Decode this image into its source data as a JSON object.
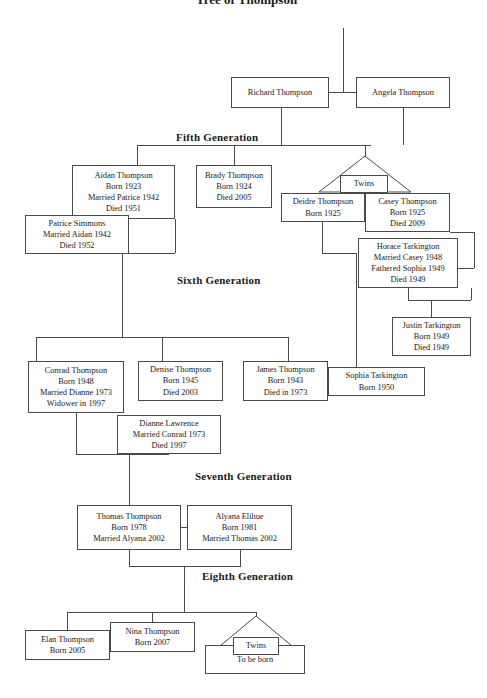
{
  "document": {
    "title": "Tree of Thompson"
  },
  "generation_headings": [
    {
      "id": "fifth",
      "label": "Fifth Generation",
      "x": 174,
      "y": 131
    },
    {
      "id": "sixth",
      "label": "Sixth Generation",
      "x": 175,
      "y": 274
    },
    {
      "id": "seventh",
      "label": "Seventh Generation",
      "x": 193,
      "y": 470
    },
    {
      "id": "eighth",
      "label": "Eighth Generation",
      "x": 200,
      "y": 570
    }
  ],
  "nodes": [
    {
      "id": "richard-thompson",
      "name": "Richard Thompson",
      "lines": [
        "Richard Thompson"
      ],
      "x": 231,
      "y": 77,
      "w": 98,
      "h": 31
    },
    {
      "id": "angela-thompson",
      "name": "Angela Thompson",
      "lines": [
        "Angela Thompson"
      ],
      "x": 356,
      "y": 77,
      "w": 94,
      "h": 31
    },
    {
      "id": "aidan-thompson",
      "name": "Aidan Thompson",
      "lines": [
        "Aidan Thompson",
        "Born 1923",
        "Married Patrice 1942",
        "Died 1951"
      ],
      "x": 72,
      "y": 165,
      "w": 103,
      "h": 54
    },
    {
      "id": "brady-thompson",
      "name": "Brady Thompson",
      "lines": [
        "Brady Thompson",
        "Born 1924",
        "Died 2005"
      ],
      "x": 196,
      "y": 165,
      "w": 76,
      "h": 43
    },
    {
      "id": "patrice-simmons",
      "name": "Patrice Simmons",
      "lines": [
        "Patrice Simmons",
        "Married Aidan 1942",
        "Died 1952"
      ],
      "x": 25,
      "y": 215,
      "w": 104,
      "h": 39
    },
    {
      "id": "deidre-thompson",
      "name": "Deidre Thompson",
      "lines": [
        "Deidre Thompson",
        "Born 1925"
      ],
      "x": 281,
      "y": 193,
      "w": 84,
      "h": 29
    },
    {
      "id": "casey-thompson",
      "name": "Casey Thompson",
      "lines": [
        "Casey Thompson",
        "Born 1925",
        "Died 2009"
      ],
      "x": 365,
      "y": 193,
      "w": 85,
      "h": 39
    },
    {
      "id": "horace-tarkington",
      "name": "Horace Tarkington",
      "lines": [
        "Horace Tarkington",
        "Married Casey 1948",
        "Fathered Sophia 1949",
        "Died 1949"
      ],
      "x": 358,
      "y": 238,
      "w": 100,
      "h": 50
    },
    {
      "id": "justin-tarkington",
      "name": "Justin Tarkington",
      "lines": [
        "Justin Tarkington",
        "Born 1949",
        "Died 1949"
      ],
      "x": 392,
      "y": 317,
      "w": 79,
      "h": 39
    },
    {
      "id": "sophia-tarkington",
      "name": "Sophia Tarkington",
      "lines": [
        "Sophia Tarkington",
        "Born 1950"
      ],
      "x": 328,
      "y": 367,
      "w": 97,
      "h": 29
    },
    {
      "id": "conrad-thompson",
      "name": "Conrad Thompson",
      "lines": [
        "Conrad Thompson",
        "Born 1948",
        "Married Dianne 1973",
        "Widower in 1997"
      ],
      "x": 28,
      "y": 361,
      "w": 96,
      "h": 52
    },
    {
      "id": "denise-thompson",
      "name": "Denise Thompson",
      "lines": [
        "Denise Thompson",
        "Born 1945",
        "Died 2003"
      ],
      "x": 138,
      "y": 361,
      "w": 85,
      "h": 40
    },
    {
      "id": "james-thompson",
      "name": "James Thompson",
      "lines": [
        "James Thompson",
        "Born 1943",
        "Died in 1973"
      ],
      "x": 243,
      "y": 361,
      "w": 85,
      "h": 40
    },
    {
      "id": "dianne-lawrence",
      "name": "Dianne Lawrence",
      "lines": [
        "Dianne Lawrence",
        "Married Conrad 1973",
        "Died 1997"
      ],
      "x": 117,
      "y": 415,
      "w": 104,
      "h": 39
    },
    {
      "id": "thomas-thompson",
      "name": "Thomas Thompson",
      "lines": [
        "Thomas Thompson",
        "Born 1978",
        "Married Alyana 2002"
      ],
      "x": 77,
      "y": 505,
      "w": 104,
      "h": 45
    },
    {
      "id": "alyana-elihue",
      "name": "Alyana Elihue",
      "lines": [
        "Alyana Elihue",
        "Born 1981",
        "Married Thomas 2002"
      ],
      "x": 187,
      "y": 505,
      "w": 105,
      "h": 45
    },
    {
      "id": "elan-thompson",
      "name": "Elan Thompson",
      "lines": [
        "Elan Thompson",
        "Born 2005"
      ],
      "x": 25,
      "y": 630,
      "w": 85,
      "h": 30
    },
    {
      "id": "nina-thompson",
      "name": "Nina Thompson",
      "lines": [
        "Nina Thompson",
        "Born 2007"
      ],
      "x": 110,
      "y": 622,
      "w": 85,
      "h": 30
    },
    {
      "id": "to-be-born",
      "name": "To be born",
      "lines": [
        "To be born"
      ],
      "x": 205,
      "y": 645,
      "w": 100,
      "h": 29
    },
    {
      "id": "twins-label-top",
      "name": "Twins",
      "lines": [
        "Twins"
      ],
      "x": 340,
      "y": 175,
      "w": 48,
      "h": 18
    },
    {
      "id": "twins-label-bottom",
      "name": "Twins",
      "lines": [
        "Twins"
      ],
      "x": 233,
      "y": 637,
      "w": 46,
      "h": 18
    }
  ],
  "twin_markers": [
    {
      "id": "twins-marker-fifth",
      "x": 318,
      "y": 155,
      "w": 94,
      "h": 38
    },
    {
      "id": "twins-marker-eighth",
      "x": 213,
      "y": 615,
      "w": 86,
      "h": 37
    }
  ],
  "connectors": {
    "horizontal": [
      {
        "id": "richard-angela-marriage",
        "x": 329,
        "y": 92,
        "w": 27
      },
      {
        "id": "gen5-sibling-bus",
        "x": 137,
        "y": 145,
        "w": 234
      },
      {
        "id": "aidan-patrice-join",
        "x": 122,
        "y": 253,
        "w": 53
      },
      {
        "id": "gen6-sibling-bus",
        "x": 36,
        "y": 337,
        "w": 252
      },
      {
        "id": "deidre-down-turn",
        "x": 322,
        "y": 253,
        "w": 34
      },
      {
        "id": "casey-horace-join",
        "x": 450,
        "y": 232,
        "w": 24
      },
      {
        "id": "casey-horace-join-low",
        "x": 458,
        "y": 268,
        "w": 16
      },
      {
        "id": "justin-parent-bus",
        "x": 408,
        "y": 300,
        "w": 63
      },
      {
        "id": "sophia-feed",
        "x": 322,
        "y": 381,
        "w": 6
      },
      {
        "id": "conrad-dianne-join",
        "x": 76,
        "y": 454,
        "w": 93
      },
      {
        "id": "thomas-alyana-marriage",
        "x": 181,
        "y": 527,
        "w": 6
      },
      {
        "id": "gen7-children-join",
        "x": 129,
        "y": 566,
        "w": 111
      },
      {
        "id": "gen8-sibling-bus",
        "x": 67,
        "y": 612,
        "w": 189
      }
    ],
    "vertical": [
      {
        "id": "top-stem",
        "x": 343,
        "y": 28,
        "h": 64
      },
      {
        "id": "richard-down",
        "x": 281,
        "y": 108,
        "h": 37
      },
      {
        "id": "angela-down",
        "x": 403,
        "y": 108,
        "h": 37
      },
      {
        "id": "aidan-stem",
        "x": 137,
        "y": 145,
        "h": 20
      },
      {
        "id": "brady-stem",
        "x": 234,
        "y": 145,
        "h": 20
      },
      {
        "id": "twins-stem",
        "x": 365,
        "y": 145,
        "h": 12
      },
      {
        "id": "aidan-child-down",
        "x": 175,
        "y": 219,
        "h": 34
      },
      {
        "id": "patrice-child-down",
        "x": 122,
        "y": 254,
        "h": 83
      },
      {
        "id": "conrad-branch",
        "x": 36,
        "y": 337,
        "h": 24
      },
      {
        "id": "denise-branch",
        "x": 162,
        "y": 337,
        "h": 24
      },
      {
        "id": "james-branch",
        "x": 288,
        "y": 337,
        "h": 24
      },
      {
        "id": "deidre-down",
        "x": 322,
        "y": 222,
        "h": 32
      },
      {
        "id": "deidre-sophia-down",
        "x": 356,
        "y": 253,
        "h": 128
      },
      {
        "id": "casey-right-down",
        "x": 474,
        "y": 232,
        "h": 36
      },
      {
        "id": "horace-down",
        "x": 408,
        "y": 288,
        "h": 12
      },
      {
        "id": "justin-parent-right",
        "x": 471,
        "y": 288,
        "h": 12
      },
      {
        "id": "justin-stem",
        "x": 431,
        "y": 300,
        "h": 17
      },
      {
        "id": "conrad-down",
        "x": 76,
        "y": 413,
        "h": 42
      },
      {
        "id": "dianne-down",
        "x": 169,
        "y": 454,
        "h": 0
      },
      {
        "id": "dianne-up",
        "x": 169,
        "y": 415,
        "h": 39
      },
      {
        "id": "gen7-stem",
        "x": 129,
        "y": 454,
        "h": 51
      },
      {
        "id": "thomas-down",
        "x": 129,
        "y": 550,
        "h": 17
      },
      {
        "id": "alyana-down",
        "x": 240,
        "y": 550,
        "h": 17
      },
      {
        "id": "gen8-stem",
        "x": 184,
        "y": 566,
        "h": 46
      },
      {
        "id": "elan-branch",
        "x": 67,
        "y": 612,
        "h": 18
      },
      {
        "id": "nina-branch",
        "x": 152,
        "y": 612,
        "h": 10
      },
      {
        "id": "twins8-branch",
        "x": 256,
        "y": 612,
        "h": 4
      }
    ]
  }
}
